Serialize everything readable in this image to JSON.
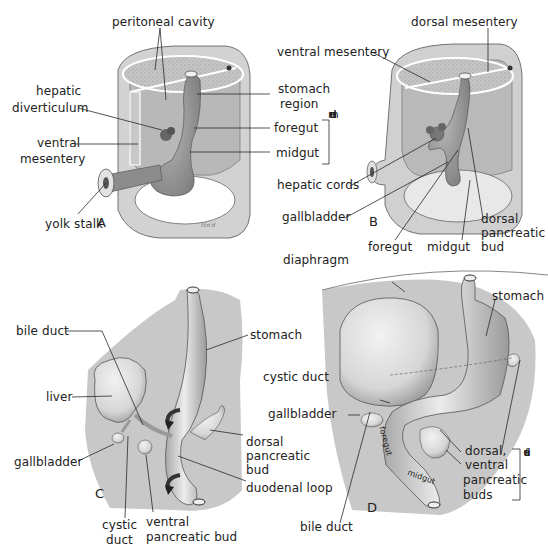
{
  "figure": {
    "panels": [
      {
        "id": "A",
        "letter": "A",
        "labels": {
          "peritoneal_cavity": "peritoneal cavity",
          "hepatic_diverticulum_1": "hepatic",
          "hepatic_diverticulum_2": "diverticulum",
          "ventral_mesentery_1": "ventral",
          "ventral_mesentery_2": "mesentery",
          "yolk_stalk": "yolk stalk",
          "stomach_region_1": "stomach",
          "stomach_region_2": "region",
          "foregut": "foregut",
          "midgut": "midgut",
          "duodenum_vertical": [
            "d",
            "u",
            "o",
            "d",
            "e",
            "n",
            "u",
            "m"
          ]
        },
        "signature": "Hn'd"
      },
      {
        "id": "B",
        "letter": "B",
        "labels": {
          "dorsal_mesentery": "dorsal mesentery",
          "ventral_mesentery": "ventral mesentery",
          "hepatic_cords": "hepatic cords",
          "gallbladder": "gallbladder",
          "foregut": "foregut",
          "midgut": "midgut",
          "dorsal_pancreatic_bud_1": "dorsal",
          "dorsal_pancreatic_bud_2": "pancreatic",
          "dorsal_pancreatic_bud_3": "bud"
        }
      },
      {
        "id": "C",
        "letter": "C",
        "labels": {
          "bile_duct": "bile duct",
          "stomach": "stomach",
          "liver": "liver",
          "gallbladder": "gallbladder",
          "dorsal_pancreatic_bud_1": "dorsal",
          "dorsal_pancreatic_bud_2": "pancreatic",
          "dorsal_pancreatic_bud_3": "bud",
          "duodenal_loop": "duodenal loop",
          "cystic_duct_1": "cystic",
          "cystic_duct_2": "duct",
          "ventral_pancreatic_bud_1": "ventral",
          "ventral_pancreatic_bud_2": "pancreatic bud"
        }
      },
      {
        "id": "D",
        "letter": "D",
        "labels": {
          "diaphragm": "diaphragm",
          "stomach": "stomach",
          "cystic_duct": "cystic duct",
          "gallbladder": "gallbladder",
          "fused_buds_1": "dorsal,",
          "fused_buds_2": "ventral",
          "fused_buds_3": "pancreatic",
          "fused_buds_4": "buds",
          "fused_vertical": [
            "f",
            "u",
            "s",
            "e",
            "d"
          ],
          "bile_duct": "bile duct",
          "foregut_inline": "foregut",
          "midgut_inline": "midgut"
        }
      }
    ],
    "colors": {
      "background": "#ffffff",
      "body_wall": "#cfcfcf",
      "body_wall_dark": "#a9a9a9",
      "cavity": "#bdbdbd",
      "organ": "#e6e6e6",
      "organ_shade": "#9a9a9a",
      "panel_bg": "#c8c8c8",
      "line": "#2a2a2a",
      "arrow": "#333333"
    }
  }
}
